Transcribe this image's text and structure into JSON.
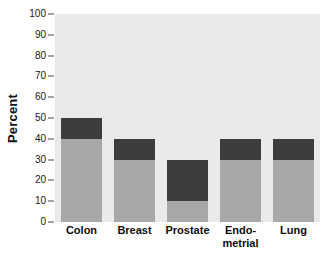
{
  "chart_data": {
    "type": "bar",
    "subtype": "stacked-bar",
    "title": "",
    "xlabel": "",
    "ylabel": "Percent",
    "ylim": [
      0,
      100
    ],
    "yticks": [
      0,
      10,
      20,
      30,
      40,
      50,
      60,
      70,
      80,
      90,
      100
    ],
    "ytick_labels": [
      "0",
      "10",
      "20",
      "30",
      "40",
      "50",
      "60",
      "70",
      "80",
      "90",
      "100"
    ],
    "grid": false,
    "legend": null,
    "categories": [
      "Colon",
      "Breast",
      "Prostate",
      "Endo-metrial",
      "Lung"
    ],
    "category_lines": [
      [
        "Colon"
      ],
      [
        "Breast"
      ],
      [
        "Prostate"
      ],
      [
        "Endo-",
        "metrial"
      ],
      [
        "Lung"
      ]
    ],
    "series": [
      {
        "name": "lower-segment",
        "color": "#a8a8a8",
        "values": [
          40,
          30,
          10,
          30,
          30
        ]
      },
      {
        "name": "upper-segment",
        "color": "#3d3d3d",
        "values": [
          10,
          10,
          20,
          10,
          10
        ]
      }
    ],
    "totals": [
      50,
      40,
      30,
      40,
      40
    ],
    "colors": {
      "plot_background": "#eaeaea",
      "page_background": "#ffffff",
      "lower_segment": "#a8a8a8",
      "upper_segment": "#3d3d3d",
      "tick": "#4a4a4a",
      "text": "#111111"
    }
  }
}
